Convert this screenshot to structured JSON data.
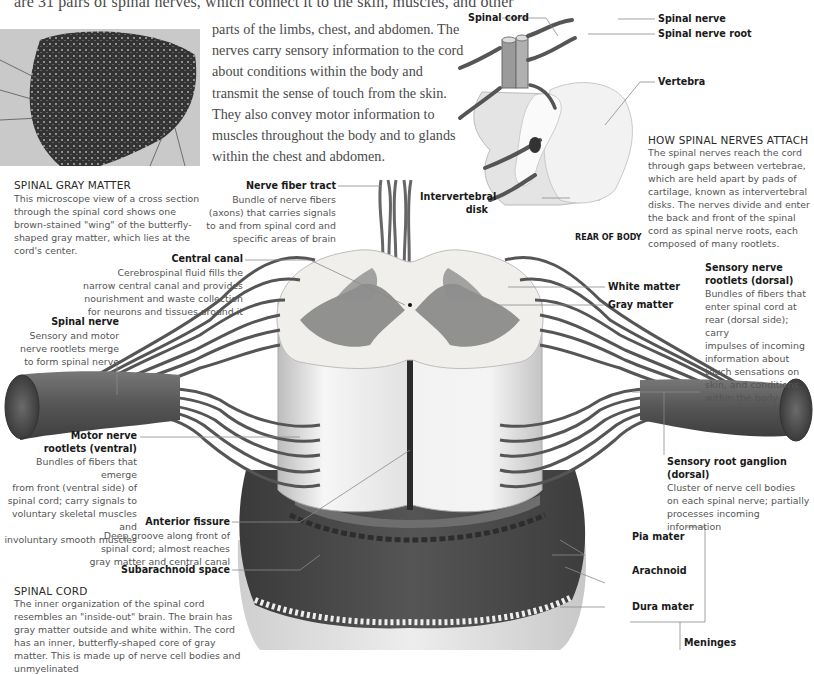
{
  "intro": {
    "first_line": "are 31 pairs of spinal nerves, which connect it to the skin, muscles, and other",
    "body": "parts of the limbs, chest, and abdomen. The nerves carry sensory information to the cord about conditions within the body and transmit the sense of touch from the skin. They also convey motor information to muscles throughout the body and to glands within the chest and abdomen."
  },
  "gray_matter_box": {
    "heading": "SPINAL GRAY MATTER",
    "text": "This microscope view of a cross section through the spinal cord shows one brown-stained \"wing\" of the butterfly-shaped gray matter, which lies at the cord's center."
  },
  "attach_box": {
    "heading": "HOW SPINAL NERVES ATTACH",
    "text": "The spinal nerves reach the cord through gaps between vertebrae, which are held apart by pads of cartilage, known as intervertebral disks. The nerves divide and enter the back and front of the spinal cord as spinal nerve roots, each composed of many rootlets."
  },
  "spinal_cord_box": {
    "heading": "SPINAL CORD",
    "text": "The inner organization of the spinal cord resembles an \"inside-out\" brain. The brain has gray matter outside and white within. The cord has an inner, butterfly-shaped core of gray matter. This is made up of nerve cell bodies and unmyelinated"
  },
  "inset_labels": {
    "spinal_cord": "Spinal cord",
    "spinal_nerve": "Spinal nerve",
    "spinal_nerve_root": "Spinal nerve root",
    "vertebra": "Vertebra",
    "intervertebral_disk_1": "Intervertebral",
    "intervertebral_disk_2": "disk",
    "rear_of_body": "REAR OF BODY"
  },
  "labels": {
    "nerve_fiber_tract": {
      "title": "Nerve fiber tract",
      "desc": [
        "Bundle of nerve fibers",
        "(axons) that carries signals",
        "to and from spinal cord and",
        "specific areas of brain"
      ]
    },
    "central_canal": {
      "title": "Central canal",
      "desc": [
        "Cerebrospinal fluid fills the",
        "narrow central canal and provides",
        "nourishment and waste collection",
        "for neurons and tissues around it"
      ]
    },
    "spinal_nerve": {
      "title": "Spinal nerve",
      "desc": [
        "Sensory and motor",
        "nerve rootlets merge",
        "to form spinal nerve"
      ]
    },
    "motor_rootlets": {
      "title1": "Motor nerve",
      "title2": "rootlets (ventral)",
      "desc": [
        "Bundles of fibers that emerge",
        "from front (ventral side) of",
        "spinal cord; carry signals to",
        "voluntary skeletal muscles and",
        "involuntary smooth muscles"
      ]
    },
    "anterior_fissure": {
      "title": "Anterior  fissure",
      "desc": [
        "Deep groove along front of",
        "spinal cord; almost reaches",
        "gray matter and central canal"
      ]
    },
    "subarachnoid_space": {
      "title": "Subarachnoid space"
    },
    "white_matter": {
      "title": "White matter"
    },
    "gray_matter": {
      "title": "Gray matter"
    },
    "sensory_rootlets": {
      "title1": "Sensory nerve",
      "title2": "rootlets (dorsal)",
      "desc": [
        "Bundles of fibers that",
        "enter spinal cord at",
        "rear (dorsal side); carry",
        "impulses of incoming",
        "information about",
        "touch sensations on",
        "skin, and conditions",
        "within the body"
      ]
    },
    "sensory_ganglion": {
      "title1": "Sensory root ganglion",
      "title2": "(dorsal)",
      "desc": [
        "Cluster of nerve cell bodies",
        "on each spinal nerve; partially",
        "processes incoming information"
      ]
    },
    "pia_mater": {
      "title": "Pia mater"
    },
    "arachnoid": {
      "title": "Arachnoid"
    },
    "dura_mater": {
      "title": "Dura mater"
    },
    "meninges": {
      "title": "Meninges"
    }
  },
  "colors": {
    "text": "#3a3a3a",
    "label": "#1a1a1a",
    "leader": "#8a8a8a",
    "nerve": "#5c5c5c",
    "white_matter": "#eeeeec",
    "gray_matter": "#7a7a7a",
    "dura": "#4a4a4a"
  }
}
